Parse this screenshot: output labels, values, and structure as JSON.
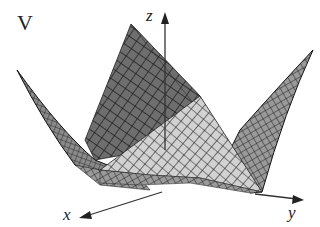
{
  "figure": {
    "title": "V",
    "axes": {
      "x": "x",
      "y": "y",
      "z": "z"
    },
    "colors": {
      "back_face": "#6e6e6e",
      "left_face": "#8a8a8a",
      "right_face": "#9a9a9a",
      "front_face": "#cfcfcf",
      "grid": "#1e1e1e",
      "axis": "#333333"
    }
  }
}
